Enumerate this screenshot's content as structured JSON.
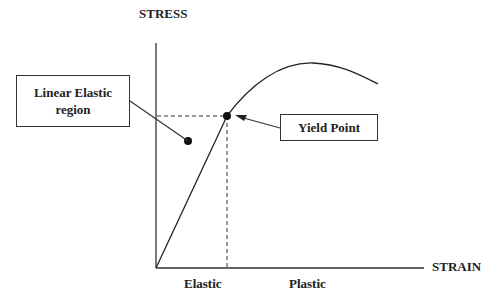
{
  "diagram": {
    "y_axis_label": "STRESS",
    "x_axis_label": "STRAIN",
    "region_labels": {
      "elastic": "Elastic",
      "plastic": "Plastic"
    },
    "callouts": {
      "linear_elastic": {
        "line1": "Linear Elastic",
        "line2": "region"
      },
      "yield_point": "Yield Point"
    },
    "colors": {
      "line": "#222222",
      "background": "#ffffff"
    }
  }
}
